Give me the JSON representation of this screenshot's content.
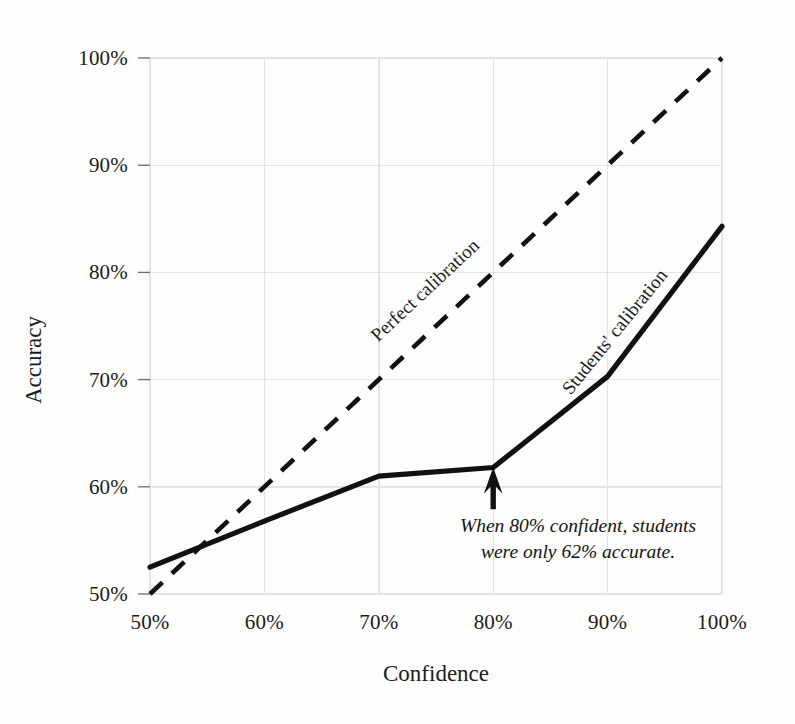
{
  "chart_data": {
    "type": "line",
    "title": "",
    "subtitle": "",
    "xlabel": "Confidence",
    "ylabel": "Accuracy",
    "xlim": [
      50,
      100
    ],
    "ylim": [
      50,
      100
    ],
    "grid": true,
    "legend_position": "inline-labels",
    "x_tick_labels": [
      "50%",
      "60%",
      "70%",
      "80%",
      "90%",
      "100%"
    ],
    "x_tick_values": [
      50,
      60,
      70,
      80,
      90,
      100
    ],
    "y_tick_labels": [
      "50%",
      "60%",
      "70%",
      "80%",
      "90%",
      "100%"
    ],
    "y_tick_values": [
      50,
      60,
      70,
      80,
      90,
      100
    ],
    "x": [
      50,
      60,
      70,
      80,
      90,
      100
    ],
    "series": [
      {
        "name": "Perfect calibration",
        "style": "dashed",
        "color": "#111111",
        "x": [
          50,
          100
        ],
        "values": [
          50,
          100
        ]
      },
      {
        "name": "Students' calibration",
        "style": "solid",
        "color": "#111111",
        "x": [
          50,
          60,
          70,
          80,
          90,
          100
        ],
        "values": [
          52.5,
          56.8,
          61.0,
          61.8,
          70.3,
          84.3
        ]
      }
    ],
    "annotations": [
      {
        "name": "students-80-percent-callout",
        "text_line_1": "When 80% confident, students",
        "text_line_2": "were only 62% accurate.",
        "points_to_x": 80,
        "points_to_y": 62,
        "arrow": "up-arrow"
      }
    ]
  },
  "axes": {
    "y_title": "Accuracy",
    "x_title": "Confidence",
    "y_ticks": [
      "100%",
      "90%",
      "80%",
      "70%",
      "60%",
      "50%"
    ],
    "x_ticks": [
      "50%",
      "60%",
      "70%",
      "80%",
      "90%",
      "100%"
    ]
  },
  "labels": {
    "perfect_calibration": "Perfect calibration",
    "students_calibration": "Students' calibration"
  },
  "annotation": {
    "line1": "When 80% confident, students",
    "line2": "were only 62% accurate."
  },
  "colors": {
    "background": "#fdfdfc",
    "ink": "#111111",
    "gridline": "#e3e3e3",
    "tick_text": "#1c1c1c"
  }
}
